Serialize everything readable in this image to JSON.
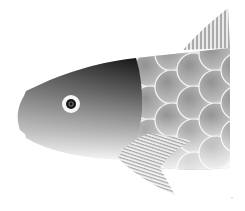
{
  "image": {
    "subject": "fish illustration",
    "style": "grayscale gradient vector",
    "width": 245,
    "height": 211
  },
  "colors": {
    "background": "#ffffff",
    "head_dark": "#141414",
    "head_light": "#f2f2f2",
    "scale_dark": "#8a8a8a",
    "scale_light": "#f4f4f4",
    "fin_stripe": "#9a9a9a",
    "eye_white": "#ffffff",
    "pupil": "#111111"
  }
}
